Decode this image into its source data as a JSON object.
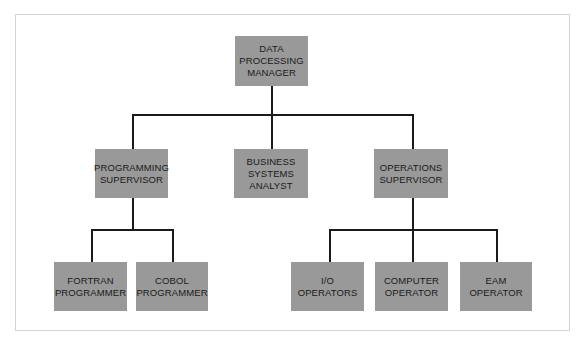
{
  "diagram": {
    "type": "org-chart",
    "nodes": {
      "manager": "DATA\nPROCESSING\nMANAGER",
      "programming_supervisor": "PROGRAMMING\nSUPERVISOR",
      "business_analyst": "BUSINESS\nSYSTEMS\nANALYST",
      "operations_supervisor": "OPERATIONS\nSUPERVISOR",
      "fortran_programmer": "FORTRAN\nPROGRAMMER",
      "cobol_programmer": "COBOL\nPROGRAMMER",
      "io_operators": "I/O\nOPERATORS",
      "computer_operator": "COMPUTER\nOPERATOR",
      "eam_operator": "EAM\nOPERATOR"
    },
    "edges": [
      [
        "manager",
        "programming_supervisor"
      ],
      [
        "manager",
        "business_analyst"
      ],
      [
        "manager",
        "operations_supervisor"
      ],
      [
        "programming_supervisor",
        "fortran_programmer"
      ],
      [
        "programming_supervisor",
        "cobol_programmer"
      ],
      [
        "operations_supervisor",
        "io_operators"
      ],
      [
        "operations_supervisor",
        "computer_operator"
      ],
      [
        "operations_supervisor",
        "eam_operator"
      ]
    ],
    "colors": {
      "box": "#999999",
      "line": "#1a1a1a",
      "text": "#1a1a1a"
    }
  }
}
